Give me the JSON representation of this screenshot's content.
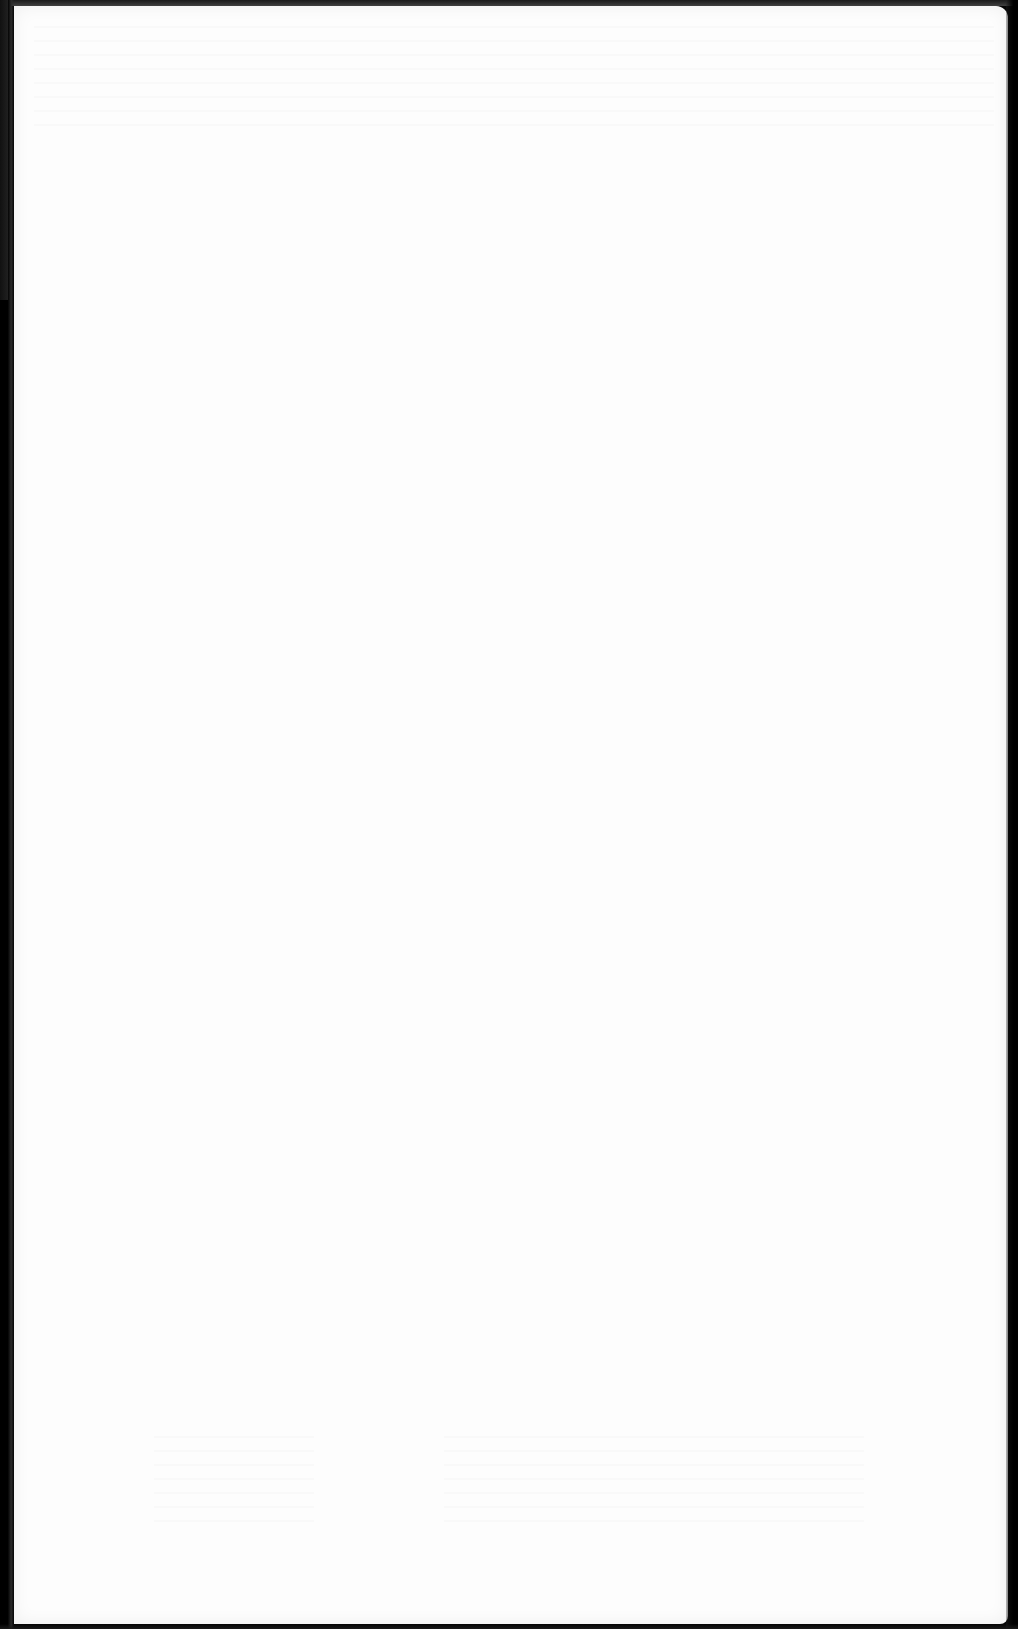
{
  "document": {
    "type": "scanned-page",
    "content": "blank",
    "text_lines": [],
    "colors": {
      "paper": "#fdfdfd",
      "scanner_background": "#050505"
    }
  }
}
